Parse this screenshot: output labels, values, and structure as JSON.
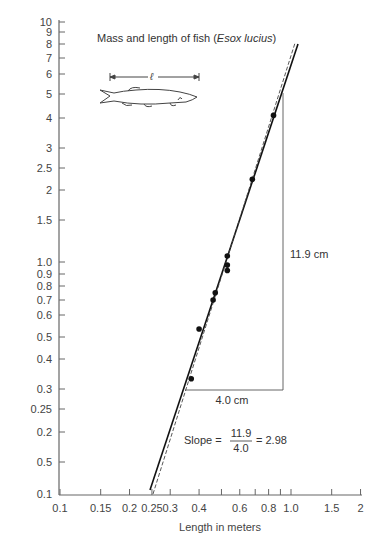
{
  "chart_data": {
    "type": "scatter",
    "title": "Mass and length of fish",
    "title_species": "Esox lucius",
    "xlabel": "Length in meters",
    "ylabel": "Mass in kg",
    "xscale": "log",
    "yscale": "log",
    "xlim": [
      0.1,
      2
    ],
    "ylim": [
      0.1,
      10
    ],
    "grid": false,
    "x_ticks": [
      "0.1",
      "0.15",
      "0.2",
      "0.25",
      "0.3",
      "0.4",
      "0.5",
      "0.6",
      "0.7",
      "0.8",
      "0.9",
      "1.0",
      "1.5",
      "2"
    ],
    "x_tick_labels_shown": [
      "0.1",
      "0.15",
      "0.2",
      "0.25",
      "0.3",
      "0.4",
      "0.6",
      "0.8",
      "1.0",
      "1.5",
      "2"
    ],
    "y_ticks": [
      "10",
      "9",
      "8",
      "7",
      "6",
      "5",
      "4",
      "3",
      "2.5",
      "2",
      "1.5",
      "1.0",
      "0.9",
      "0.8",
      "0.7",
      "0.6",
      "0.5",
      "0.4",
      "0.3",
      "0.25",
      "0.2",
      "0.5",
      "0.1"
    ],
    "series": [
      {
        "name": "Measured fish",
        "marker": "dot",
        "points": [
          {
            "x": 0.37,
            "y": 0.32
          },
          {
            "x": 0.4,
            "y": 0.52
          },
          {
            "x": 0.46,
            "y": 0.69
          },
          {
            "x": 0.47,
            "y": 0.74
          },
          {
            "x": 0.53,
            "y": 0.92
          },
          {
            "x": 0.53,
            "y": 0.97
          },
          {
            "x": 0.53,
            "y": 1.06
          },
          {
            "x": 0.68,
            "y": 2.24
          },
          {
            "x": 0.84,
            "y": 4.18
          }
        ]
      },
      {
        "name": "Best-fit line (solid)",
        "style": "solid",
        "from": {
          "x": 0.25,
          "y": 0.12
        },
        "to": {
          "x": 1.08,
          "y": 9.2
        }
      },
      {
        "name": "Reference line (dashed)",
        "style": "dashed",
        "from": {
          "x": 0.255,
          "y": 0.115
        },
        "to": {
          "x": 1.06,
          "y": 9.3
        }
      }
    ],
    "annotations": {
      "rise": "11.9 cm",
      "run": "4.0 cm",
      "slope_label": "Slope =",
      "slope_numerator": "11.9",
      "slope_denominator": "4.0",
      "slope_result": "= 2.98"
    },
    "inset": {
      "symbol": "ℓ",
      "description": "fish drawing with length dimension"
    }
  }
}
